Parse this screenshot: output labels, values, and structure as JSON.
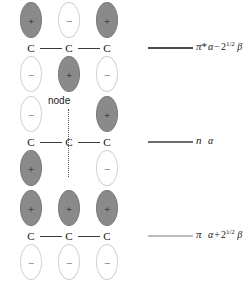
{
  "figure": {
    "atom_label": "C",
    "node_label": "node",
    "sign_positive": "+",
    "sign_negative": "−",
    "colors": {
      "lobe_positive_fill": "#8a8a8a",
      "lobe_negative_fill": "#ffffff",
      "lobe_negative_stroke": "#d2d2d2",
      "bond_stroke": "#3a3a3a",
      "background": "#ffffff"
    }
  },
  "rows": [
    {
      "name": "antibonding",
      "orbital_symbol": "π",
      "orbital_superscript": "*",
      "level_color": "#4a4a4a",
      "has_node_marker": false,
      "energy": {
        "alpha": "α",
        "operator": "−",
        "coefficient": "2",
        "exponent": "1/2",
        "beta": "β",
        "text": "α − 2^(1/2) β"
      },
      "lobes_top": [
        "+",
        "−",
        "+"
      ],
      "lobes_bottom": [
        "−",
        "+",
        "−"
      ]
    },
    {
      "name": "nonbonding",
      "orbital_symbol": "n",
      "orbital_superscript": "",
      "level_color": "#6e6e6e",
      "has_node_marker": true,
      "energy": {
        "alpha": "α",
        "operator": "",
        "coefficient": "",
        "exponent": "",
        "beta": "",
        "text": "α"
      },
      "lobes_top": [
        "−",
        null,
        "+"
      ],
      "lobes_bottom": [
        "+",
        null,
        "−"
      ]
    },
    {
      "name": "bonding",
      "orbital_symbol": "π",
      "orbital_superscript": "",
      "level_color": "#bcbcbc",
      "has_node_marker": false,
      "energy": {
        "alpha": "α",
        "operator": "+",
        "coefficient": "2",
        "exponent": "1/2",
        "beta": "β",
        "text": "α + 2^(1/2) β"
      },
      "lobes_top": [
        "+",
        "+",
        "+"
      ],
      "lobes_bottom": [
        "−",
        "−",
        "−"
      ]
    }
  ]
}
